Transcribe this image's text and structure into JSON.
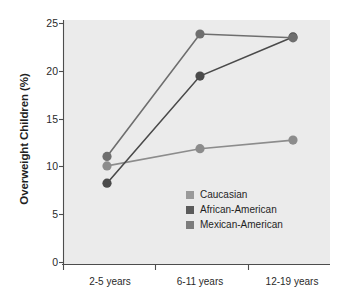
{
  "chart_data": {
    "type": "line",
    "title": "",
    "subtitle": "",
    "xlabel": "",
    "ylabel": "Overweight Children (%)",
    "categories": [
      "2-5 years",
      "6-11 years",
      "12-19 years"
    ],
    "yticks": [
      "0",
      "5",
      "10",
      "15",
      "20",
      "25"
    ],
    "ylim": [
      0,
      25
    ],
    "grid": false,
    "legend_position": "inside-lower-right",
    "series": [
      {
        "name": "Caucasian",
        "values": [
          10.1,
          11.9,
          12.8
        ],
        "color": "#8c8c8c",
        "swatch_color": "#9a9a9a"
      },
      {
        "name": "African-American",
        "values": [
          8.3,
          19.5,
          23.6
        ],
        "color": "#4a4a4a",
        "swatch_color": "#5b5b5b"
      },
      {
        "name": "Mexican-American",
        "values": [
          11.1,
          23.9,
          23.5
        ],
        "color": "#6e6e6e",
        "swatch_color": "#7c7c7c"
      }
    ],
    "plot_background": "#ebebeb",
    "page_background": "#ffffff",
    "axis_color": "#4d4d4d"
  }
}
